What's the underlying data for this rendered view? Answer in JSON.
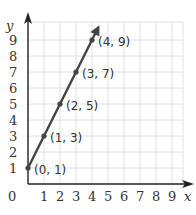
{
  "chart_data": {
    "type": "line",
    "title": "",
    "xlabel": "x",
    "ylabel": "y",
    "xlim": [
      0,
      9
    ],
    "ylim": [
      0,
      9
    ],
    "grid": true,
    "x_ticks": [
      "0",
      "1",
      "2",
      "3",
      "4",
      "5",
      "6",
      "7",
      "8",
      "9"
    ],
    "y_ticks": [
      "1",
      "2",
      "3",
      "4",
      "5",
      "6",
      "7",
      "8",
      "9"
    ],
    "series": [
      {
        "name": "y = 2x + 1",
        "points": [
          {
            "x": 0,
            "y": 1,
            "label": "(0, 1)"
          },
          {
            "x": 1,
            "y": 3,
            "label": "(1, 3)"
          },
          {
            "x": 2,
            "y": 5,
            "label": "(2, 5)"
          },
          {
            "x": 3,
            "y": 7,
            "label": "(3, 7)"
          },
          {
            "x": 4,
            "y": 9,
            "label": "(4, 9)"
          }
        ]
      }
    ],
    "annotations": [
      "(0, 1)",
      "(1, 3)",
      "(2, 5)",
      "(3, 7)",
      "(4, 9)"
    ]
  },
  "colors": {
    "line": "#444444",
    "axis": "#222222",
    "grid": "#e0e0e0",
    "text": "#333333"
  }
}
